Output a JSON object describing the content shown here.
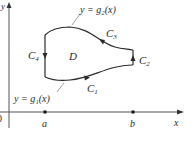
{
  "diagram": {
    "axes": {
      "x_label": "x",
      "y_label": "y",
      "origin_label": "0"
    },
    "points": [
      {
        "label": "a"
      },
      {
        "label": "b"
      }
    ],
    "region": {
      "label": "D"
    },
    "curves": {
      "upper": {
        "label": "y = g₂(x)"
      },
      "lower": {
        "label": "y = g₁(x)"
      }
    },
    "boundary": [
      {
        "name": "C1",
        "main": "C",
        "sub": "1"
      },
      {
        "name": "C2",
        "main": "C",
        "sub": "2"
      },
      {
        "name": "C3",
        "main": "C",
        "sub": "3"
      },
      {
        "name": "C4",
        "main": "C",
        "sub": "4"
      }
    ],
    "colors": {
      "line": "#2a2a2a",
      "axis": "#555555",
      "leader": "#888888"
    }
  }
}
